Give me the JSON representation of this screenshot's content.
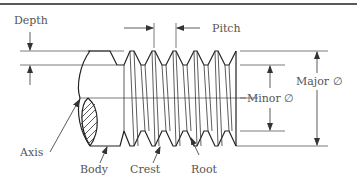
{
  "diagram": {
    "type": "screw-thread-terminology",
    "labels": {
      "depth": "Depth",
      "pitch": "Pitch",
      "minor": "Minor ∅",
      "major": "Major ∅",
      "axis": "Axis",
      "body": "Body",
      "crest": "Crest",
      "root": "Root"
    },
    "colors": {
      "line": "#333333",
      "text": "#555555",
      "border": "#222222"
    }
  }
}
